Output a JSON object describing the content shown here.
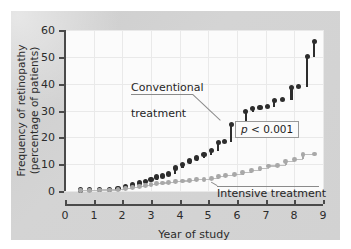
{
  "chart_data": {
    "type": "line",
    "title": "",
    "subtitle": "",
    "xlabel": "Year of study",
    "ylabel": "Frequency of retinopathy\n(percentage of patients)",
    "ylabel_line1": "Frequency of retinopathy",
    "ylabel_line2": "(percentage of patients)",
    "xlim": [
      0,
      9
    ],
    "ylim": [
      0,
      60
    ],
    "xticks": [
      0,
      1,
      2,
      3,
      4,
      5,
      6,
      7,
      8,
      9
    ],
    "yticks": [
      0,
      10,
      20,
      30,
      40,
      50,
      60
    ],
    "xtick_labels": [
      "0",
      "1",
      "2",
      "3",
      "4",
      "5",
      "6",
      "7",
      "8",
      "9"
    ],
    "ytick_labels": [
      "0",
      "10",
      "20",
      "30",
      "40",
      "50",
      "60"
    ],
    "grid": true,
    "grid_color": "#e9e9e9",
    "legend_position": "inline-annotations",
    "step_style": true,
    "series": [
      {
        "name": "Conventional treatment",
        "color": "#2d2d2d",
        "marker": "filled-circle",
        "x": [
          0.55,
          0.85,
          1.2,
          1.55,
          1.85,
          2.1,
          2.35,
          2.6,
          2.8,
          3.0,
          3.2,
          3.4,
          3.6,
          3.85,
          4.1,
          4.35,
          4.6,
          4.85,
          5.1,
          5.35,
          5.55,
          5.8,
          6.05,
          6.3,
          6.55,
          6.8,
          7.05,
          7.3,
          7.6,
          7.9,
          8.15,
          8.45,
          8.7
        ],
        "y": [
          0.4,
          0.5,
          0.6,
          0.7,
          1.0,
          1.6,
          2.2,
          3.0,
          3.6,
          4.2,
          5.2,
          5.6,
          6.3,
          8.6,
          10.0,
          11.2,
          12.3,
          13.6,
          15.0,
          18.2,
          18.4,
          24.8,
          25.0,
          29.6,
          30.6,
          31.2,
          31.4,
          33.8,
          34.0,
          38.6,
          38.8,
          50.0,
          55.8
        ]
      },
      {
        "name": "Intensive treatment",
        "color": "#a8a8a8",
        "marker": "filled-circle",
        "x": [
          0.55,
          0.85,
          1.2,
          1.55,
          1.85,
          2.1,
          2.35,
          2.6,
          2.8,
          3.0,
          3.2,
          3.4,
          3.6,
          3.85,
          4.1,
          4.35,
          4.6,
          4.85,
          5.1,
          5.35,
          5.6,
          5.9,
          6.2,
          6.5,
          6.8,
          7.1,
          7.4,
          7.7,
          8.0,
          8.3,
          8.7
        ],
        "y": [
          0.3,
          0.3,
          0.4,
          0.4,
          0.5,
          1.0,
          1.2,
          1.6,
          2.0,
          2.4,
          2.8,
          3.0,
          3.2,
          3.4,
          3.7,
          4.0,
          4.2,
          4.4,
          4.6,
          5.4,
          5.8,
          6.1,
          6.8,
          7.5,
          8.4,
          9.3,
          9.6,
          11.0,
          11.8,
          13.6,
          13.8
        ]
      }
    ],
    "annotations": [
      {
        "id": "conventional-label",
        "text": "Conventional\ntreatment",
        "line1": "Conventional",
        "line2": "treatment",
        "points_to_x": 5.5,
        "points_to_y": 25
      },
      {
        "id": "intensive-label",
        "text": "Intensive treatment",
        "points_to_x": 5.1,
        "points_to_y": 4.6
      },
      {
        "id": "p-value-box",
        "p_symbol": "p",
        "text": " < 0.001",
        "full_text": "p < 0.001"
      }
    ]
  }
}
